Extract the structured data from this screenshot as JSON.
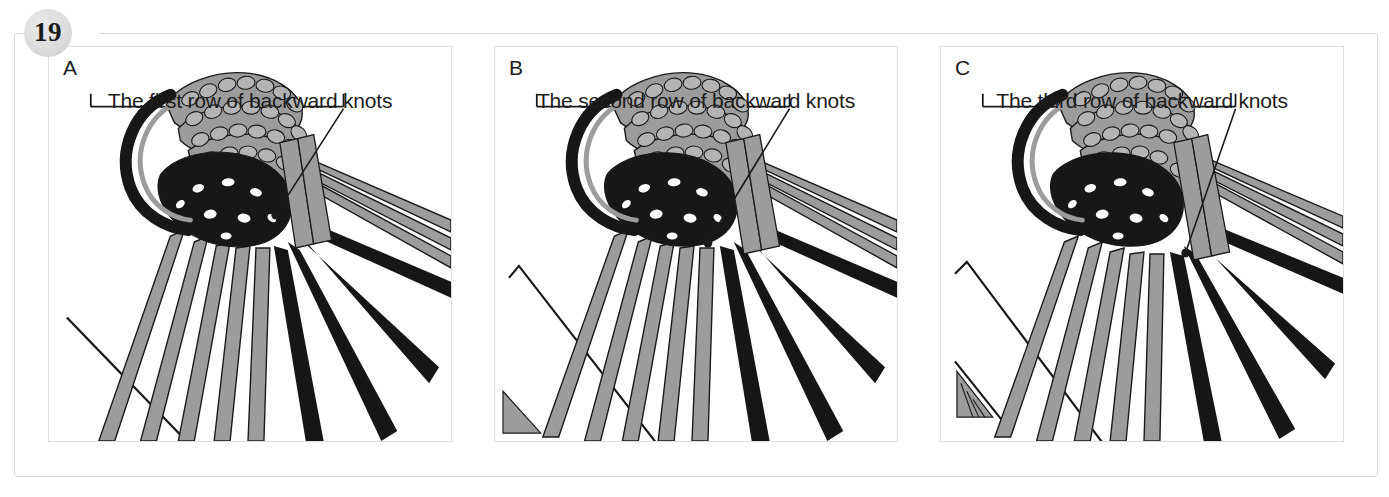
{
  "page": {
    "number_badge": "19",
    "background_color": "#ffffff",
    "frame_color": "#d8d8d8"
  },
  "colors": {
    "cord_gray_fill": "#9c9c9c",
    "cord_gray_stroke": "#1a1a1a",
    "cord_black": "#161616",
    "guide_line": "#1a1a1a",
    "text": "#1d1d1d",
    "panel_border": "#dedede",
    "badge_fill": "#dcdcdc"
  },
  "panels": [
    {
      "letter": "A",
      "caption": "The first row of backward knots",
      "bracket": {
        "tick_left": true,
        "tick_right": true
      },
      "pointer": {
        "has_dot": true
      },
      "art_alt": "macrame knotting diagram, first backward knot row"
    },
    {
      "letter": "B",
      "caption": "The second row of backward knots",
      "bracket": {
        "tick_left": true,
        "tick_right": true
      },
      "pointer": {
        "has_dot": true
      },
      "art_alt": "macrame knotting diagram, second backward knot row"
    },
    {
      "letter": "C",
      "caption": "The third row of backward knots",
      "bracket": {
        "tick_left": true,
        "tick_right": true
      },
      "pointer": {
        "has_dot": true
      },
      "art_alt": "macrame knotting diagram, third backward knot row"
    }
  ]
}
